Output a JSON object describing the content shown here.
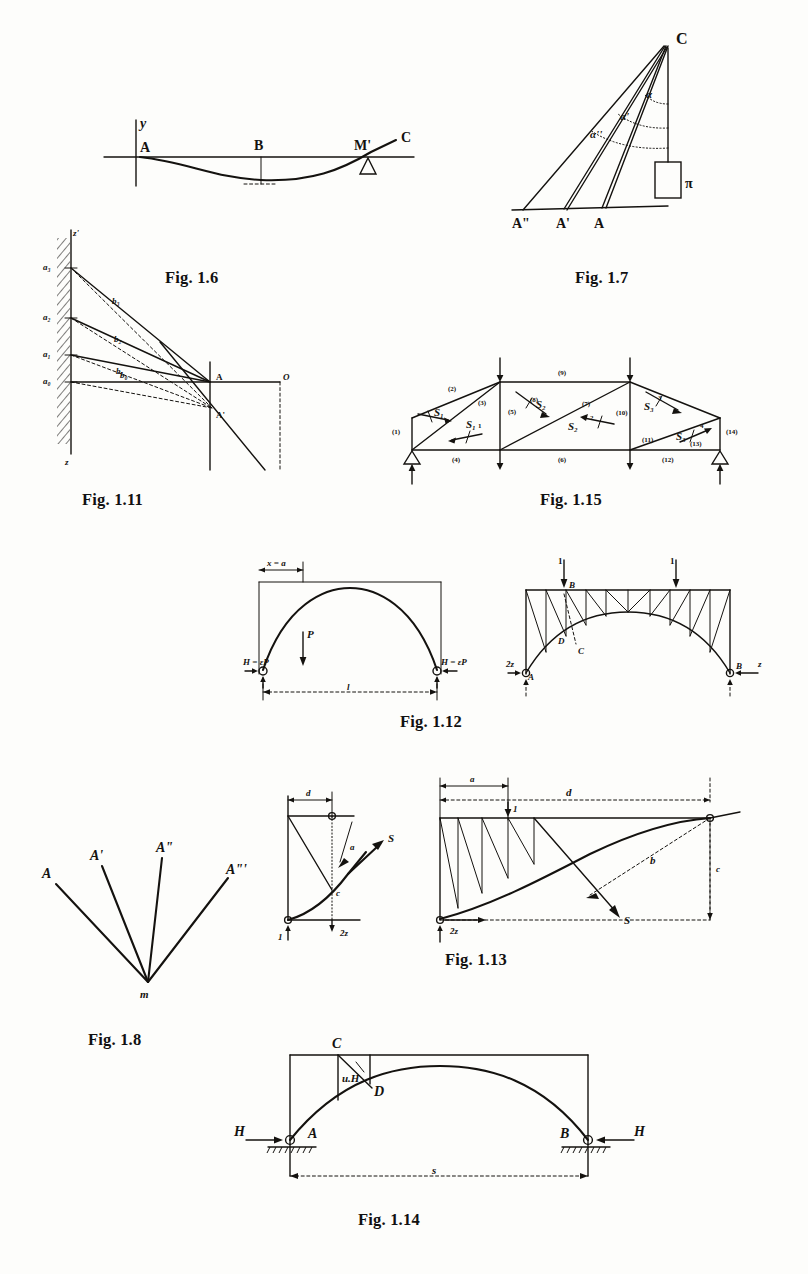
{
  "page": {
    "kind": "scanned-textbook-figure-plate",
    "background_color": "#fdfdfb",
    "ink_color": "#14120f"
  },
  "captions": {
    "fig16": "Fig. 1.6",
    "fig17": "Fig. 1.7",
    "fig111": "Fig. 1.11",
    "fig115": "Fig. 1.15",
    "fig112": "Fig. 1.12",
    "fig18": "Fig. 1.8",
    "fig113": "Fig. 1.13",
    "fig114": "Fig. 1.14"
  },
  "fig16": {
    "caption": "Fig. 1.6",
    "labels": {
      "y_axis": "y",
      "point_a": "A",
      "point_b": "B",
      "point_m_prime": "M'",
      "point_c": "C"
    }
  },
  "fig17": {
    "caption": "Fig. 1.7",
    "labels": {
      "apex": "C",
      "angle1": "α",
      "angle2": "α'",
      "angle3": "α''",
      "weight": "π",
      "base_a": "A",
      "base_a_prime": "A'",
      "base_a_dprime": "A\""
    }
  },
  "fig111": {
    "caption": "Fig. 1.11",
    "labels": {
      "wall_top": "z'",
      "wall_bottom": "z",
      "a3": "a₃",
      "a2": "a₂",
      "a1": "a₁",
      "a0": "a₀",
      "b3": "b₃",
      "b2": "b₂",
      "b1": "b₁",
      "b0": "b₀",
      "point_a_upper": "A",
      "point_a_lower": "A'",
      "point_o": "O"
    }
  },
  "fig115": {
    "caption": "Fig. 1.15",
    "members": [
      "(1)",
      "(2)",
      "(3)",
      "(4)",
      "(5)",
      "(6)",
      "(7)",
      "(8)",
      "(9)",
      "(10)",
      "(11)",
      "(12)",
      "(13)",
      "(14)"
    ],
    "forces": {
      "s1_top": "S₁",
      "s1_bottom": "S₁",
      "s2_top": "S₂",
      "s2_bottom": "S₂",
      "s3_top": "S₃",
      "s3_bottom": "S₃"
    },
    "tick_numbers": [
      "1",
      "2",
      "3",
      "4"
    ]
  },
  "fig112": {
    "caption": "Fig. 1.12",
    "left": {
      "dim_top": "x = a",
      "load": "P",
      "thrust_left": "H = εP",
      "thrust_right": "H = εP",
      "span": "l"
    },
    "right": {
      "load_left": "1",
      "load_right": "1",
      "node_b": "B",
      "node_d": "D",
      "node_c": "C",
      "support_left": "A",
      "support_right": "B",
      "thrust_left": "2z",
      "thrust_right": "z"
    }
  },
  "fig18": {
    "caption": "Fig. 1.8",
    "labels": {
      "ray1": "A",
      "ray2": "A'",
      "ray3": "A\"",
      "ray4": "A\"'",
      "origin": "m"
    }
  },
  "fig113": {
    "caption": "Fig. 1.13",
    "inset": {
      "dim_d": "d",
      "diag_a": "a",
      "force_s": "S",
      "height_c": "c",
      "load_1": "1",
      "reaction": "2z"
    },
    "main": {
      "dim_a": "a",
      "dim_d": "d",
      "dim_c": "c",
      "load_1": "1",
      "lever_b": "b",
      "force_s": "S",
      "reaction": "2z"
    }
  },
  "fig114": {
    "caption": "Fig. 1.14",
    "labels": {
      "node_c": "C",
      "node_d": "D",
      "moment_arm": "u.H",
      "support_a": "A",
      "support_b": "B",
      "thrust_left": "H",
      "thrust_right": "H",
      "span": "s"
    }
  }
}
